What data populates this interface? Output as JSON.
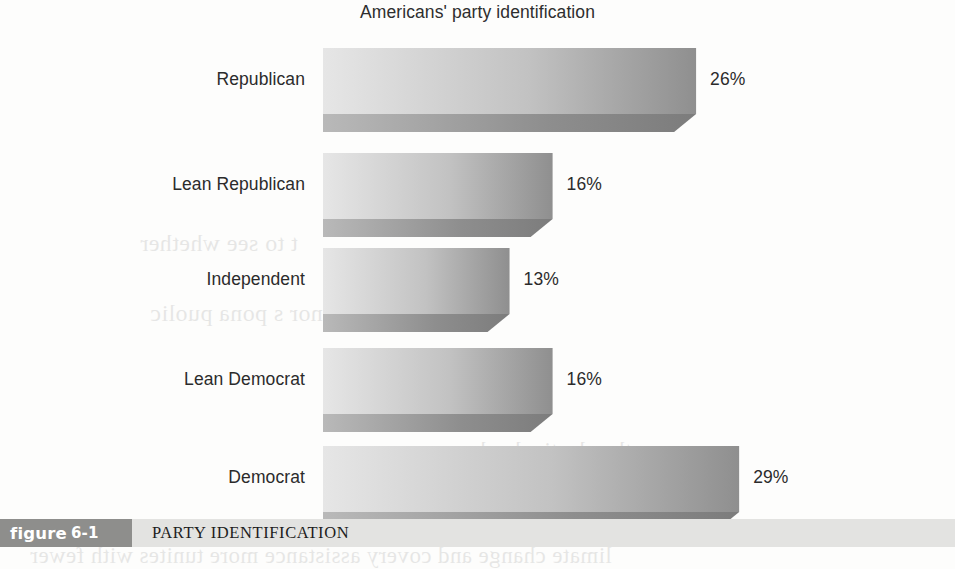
{
  "figure": {
    "title": "Americans' party identification",
    "caption_tag_word": "figure",
    "caption_tag_number": "6-1",
    "caption_text": "PARTY IDENTIFICATION",
    "tag_background": "#8e8e8c",
    "caption_background": "#e3e3e1"
  },
  "chart_data": {
    "type": "bar",
    "orientation": "horizontal",
    "title": "Americans' party identification",
    "xlabel": "",
    "ylabel": "",
    "categories": [
      "Republican",
      "Lean Republican",
      "Independent",
      "Lean Democrat",
      "Democrat"
    ],
    "values": [
      26,
      16,
      13,
      16,
      29
    ],
    "value_labels": [
      "26%",
      "16%",
      "13%",
      "16%",
      "29%"
    ],
    "unit": "%",
    "xlim": [
      0,
      30
    ],
    "grid": false,
    "legend": null,
    "bar_style": {
      "fill_light": "#e6e6e6",
      "fill_dark": "#8f8f8f",
      "shadow": "#7c7c7c",
      "effect": "3d-beveled-gradient"
    }
  },
  "background_bleed": [
    "the electively choose",
    "difficult fac",
    "t to see whether",
    "in honor s pona puolic",
    "limate change and covery assistance more tunites with fewer"
  ]
}
